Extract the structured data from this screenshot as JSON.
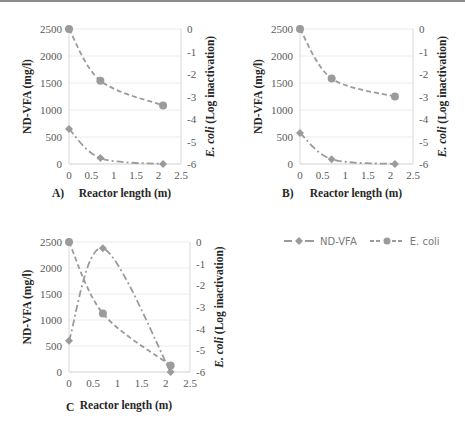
{
  "colors": {
    "series": "#9b9b9b",
    "grid": "#ececec",
    "axis": "#d9d9d9",
    "tick_text": "#595959",
    "title_text": "#262626"
  },
  "legend": {
    "items": [
      {
        "label": "ND-VFA",
        "marker": "diamond",
        "dash": "dash-dot"
      },
      {
        "label": "E. coli",
        "marker": "circle",
        "dash": "dashed"
      }
    ]
  },
  "chart_data": [
    {
      "type": "line",
      "panel_label": "A)",
      "xlabel": "Reactor length (m)",
      "ylabel": "ND-VFA (mg/l)",
      "y2label_italic": "E. coli",
      "y2label_rest": " (Log inactivation)",
      "xlim": [
        0,
        2.5
      ],
      "ylim": [
        0,
        2500
      ],
      "y2lim": [
        -6,
        0
      ],
      "xticks": [
        "0",
        "0.5",
        "1",
        "1.5",
        "2",
        "2.5"
      ],
      "yticks": [
        "0",
        "500",
        "1000",
        "1500",
        "2000",
        "2500"
      ],
      "y2ticks": [
        "-6",
        "-5",
        "-4",
        "-3",
        "-2",
        "-1",
        "0"
      ],
      "grid": true,
      "x": [
        0,
        0.7,
        2.1
      ],
      "series": [
        {
          "name": "ND-VFA",
          "axis": "left",
          "marker": "diamond",
          "values": [
            650,
            110,
            0
          ]
        },
        {
          "name": "E. coli",
          "axis": "right",
          "marker": "circle",
          "values": [
            0,
            -2.3,
            -3.4
          ]
        }
      ]
    },
    {
      "type": "line",
      "panel_label": "B)",
      "xlabel": "Reactor length (m)",
      "ylabel": "ND-VFA (mg/l)",
      "y2label_italic": "E. coli",
      "y2label_rest": " (Log inactivation)",
      "xlim": [
        0,
        2.5
      ],
      "ylim": [
        0,
        2500
      ],
      "y2lim": [
        -6,
        0
      ],
      "xticks": [
        "0",
        "0.5",
        "1",
        "1.5",
        "2",
        "2.5"
      ],
      "yticks": [
        "0",
        "500",
        "1000",
        "1500",
        "2000",
        "2500"
      ],
      "y2ticks": [
        "-6",
        "-5",
        "-4",
        "-3",
        "-2",
        "-1",
        "0"
      ],
      "grid": true,
      "x": [
        0,
        0.7,
        2.1
      ],
      "series": [
        {
          "name": "ND-VFA",
          "axis": "left",
          "marker": "diamond",
          "values": [
            575,
            90,
            0
          ]
        },
        {
          "name": "E. coli",
          "axis": "right",
          "marker": "circle",
          "values": [
            0,
            -2.2,
            -3.0
          ]
        }
      ]
    },
    {
      "type": "line",
      "panel_label": "C",
      "xlabel": "Reactor length (m)",
      "ylabel": "ND-VFA (mg/l)",
      "y2label_italic": "E. coli",
      "y2label_rest": " (Log inactivation)",
      "xlim": [
        0,
        2.5
      ],
      "ylim": [
        0,
        2500
      ],
      "y2lim": [
        -6,
        0
      ],
      "xticks": [
        "0",
        "0.5",
        "1",
        "1.5",
        "2",
        "2.5"
      ],
      "yticks": [
        "0",
        "500",
        "1000",
        "1500",
        "2000",
        "2500"
      ],
      "y2ticks": [
        "-6",
        "-5",
        "-4",
        "-3",
        "-2",
        "-1",
        "0"
      ],
      "grid": true,
      "x": [
        0,
        0.7,
        2.1
      ],
      "series": [
        {
          "name": "ND-VFA",
          "axis": "left",
          "marker": "diamond",
          "values": [
            600,
            2380,
            0
          ]
        },
        {
          "name": "E. coli",
          "axis": "right",
          "marker": "circle",
          "values": [
            0,
            -3.3,
            -5.7
          ]
        }
      ]
    }
  ]
}
